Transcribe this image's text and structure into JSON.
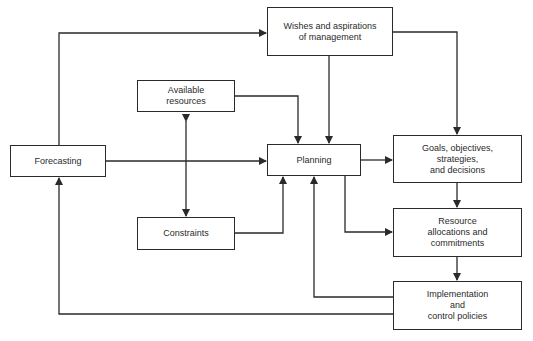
{
  "diagram": {
    "type": "flowchart",
    "nodes": {
      "wishes": {
        "label": "Wishes and aspirations\nof management"
      },
      "available_resources": {
        "label": "Available\nresources"
      },
      "forecasting": {
        "label": "Forecasting"
      },
      "planning": {
        "label": "Planning"
      },
      "goals": {
        "label": "Goals, objectives,\nstrategies,\nand decisions"
      },
      "constraints": {
        "label": "Constraints"
      },
      "resource_allocations": {
        "label": "Resource\nallocations and\ncommitments"
      },
      "implementation": {
        "label": "Implementation\nand\ncontrol policies"
      }
    },
    "edges": [
      {
        "from": "forecasting",
        "to": "wishes"
      },
      {
        "from": "forecasting",
        "to": "planning"
      },
      {
        "from": "wishes",
        "to": "planning"
      },
      {
        "from": "wishes",
        "to": "goals"
      },
      {
        "from": "available_resources",
        "to": "planning"
      },
      {
        "from": "available_resources",
        "to": "constraints",
        "bidirectional": true
      },
      {
        "from": "constraints",
        "to": "planning"
      },
      {
        "from": "planning",
        "to": "goals"
      },
      {
        "from": "planning",
        "to": "resource_allocations"
      },
      {
        "from": "goals",
        "to": "resource_allocations"
      },
      {
        "from": "resource_allocations",
        "to": "implementation"
      },
      {
        "from": "implementation",
        "to": "planning"
      },
      {
        "from": "implementation",
        "to": "forecasting"
      }
    ],
    "colors": {
      "line": "#2a2a2a",
      "background": "#ffffff"
    }
  }
}
